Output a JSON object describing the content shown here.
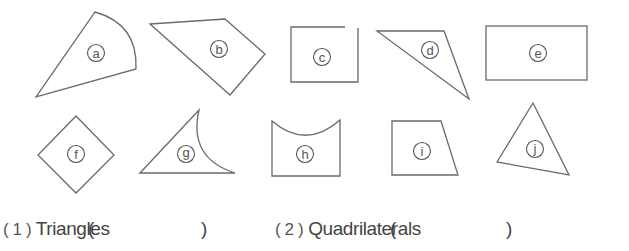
{
  "shapes": [
    {
      "id": "a",
      "label": "a",
      "kind": "curved-sector"
    },
    {
      "id": "b",
      "label": "b",
      "kind": "quadrilateral"
    },
    {
      "id": "c",
      "label": "c",
      "kind": "open-rectangle"
    },
    {
      "id": "d",
      "label": "d",
      "kind": "triangle"
    },
    {
      "id": "e",
      "label": "e",
      "kind": "rectangle"
    },
    {
      "id": "f",
      "label": "f",
      "kind": "square-rotated"
    },
    {
      "id": "g",
      "label": "g",
      "kind": "curved-triangle"
    },
    {
      "id": "h",
      "label": "h",
      "kind": "curved-quadrilateral"
    },
    {
      "id": "i",
      "label": "i",
      "kind": "trapezoid"
    },
    {
      "id": "j",
      "label": "j",
      "kind": "triangle"
    }
  ],
  "questions": [
    {
      "number": "( 1 )",
      "text": "Triangles",
      "open": "(",
      "close": ")",
      "answer": ""
    },
    {
      "number": "( 2 )",
      "text": "Quadrilaterals",
      "open": "(",
      "close": ")",
      "answer": ""
    }
  ],
  "colors": {
    "stroke": "#6a6a6a",
    "text": "#444444",
    "background": "#ffffff"
  }
}
